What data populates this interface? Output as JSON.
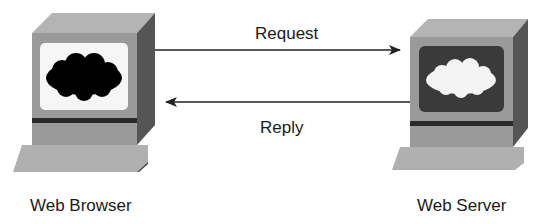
{
  "diagram": {
    "nodes": [
      {
        "id": "client",
        "label": "Web Browser",
        "screen_style": "white-screen-black-cloud"
      },
      {
        "id": "server",
        "label": "Web Server",
        "screen_style": "dark-screen-white-cloud"
      }
    ],
    "edges": [
      {
        "from": "client",
        "to": "server",
        "label": "Request"
      },
      {
        "from": "server",
        "to": "client",
        "label": "Reply"
      }
    ]
  },
  "colors": {
    "front": "#9a9a9a",
    "top": "#b4b4b4",
    "side": "#555555",
    "dark_strip": "#2a2a2a",
    "keyboard": "#b0b0b0",
    "server_screen": "#3a3a3a",
    "client_screen": "#f6f6f6"
  }
}
